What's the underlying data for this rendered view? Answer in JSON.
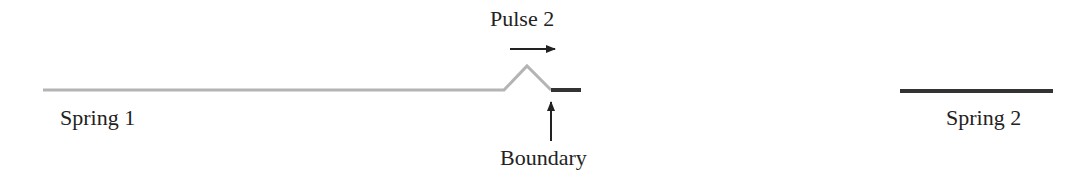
{
  "labels": {
    "pulse": "Pulse 2",
    "spring1": "Spring 1",
    "spring2": "Spring 2",
    "boundary": "Boundary"
  },
  "colors": {
    "spring1": "#b4b4b4",
    "spring2": "#333333",
    "arrow": "#222222",
    "text": "#222222"
  }
}
